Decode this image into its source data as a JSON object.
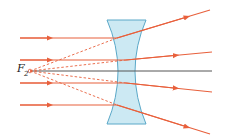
{
  "diagram": {
    "type": "diverging-lens-ray-diagram",
    "focal_point_label": "F",
    "focal_point_subscript": "2",
    "colors": {
      "ray": "#e8603c",
      "axis": "#555555",
      "lens_fill": "#cce9f3",
      "lens_stroke": "#5aa8c8"
    },
    "rays": [
      {
        "incoming_y": 38,
        "outgoing_end": [
          210,
          10
        ]
      },
      {
        "incoming_y": 60,
        "outgoing_end": [
          212,
          52
        ]
      },
      {
        "incoming_y": 83,
        "outgoing_end": [
          212,
          92
        ]
      },
      {
        "incoming_y": 105,
        "outgoing_end": [
          210,
          134
        ]
      }
    ]
  }
}
